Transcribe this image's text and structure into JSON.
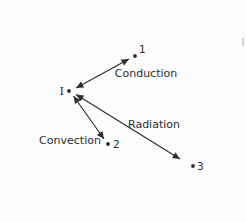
{
  "diagram": {
    "colors": {
      "ink": "#2e2e2e",
      "background": "#fcfcfc"
    },
    "points": {
      "I": "I",
      "p1": "1",
      "p2": "2",
      "p3": "3"
    },
    "arrows": [
      {
        "from": "I",
        "to": "1",
        "label": "Conduction",
        "double_headed": true
      },
      {
        "from": "I",
        "to": "2",
        "label": "Convection",
        "double_headed": true
      },
      {
        "from": "I",
        "to": "3",
        "label": "Radiation",
        "double_headed": true
      }
    ]
  }
}
